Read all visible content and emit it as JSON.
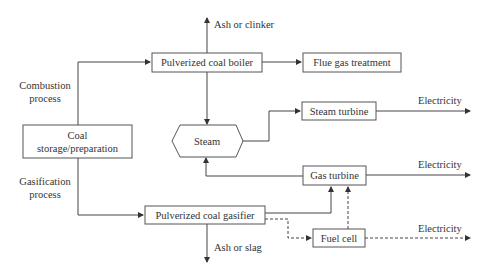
{
  "diagram": {
    "nodes": {
      "coal_storage": {
        "line1": "Coal",
        "line2": "storage/preparation"
      },
      "boiler": {
        "label": "Pulverized coal boiler"
      },
      "flue_gas": {
        "label": "Flue gas treatment"
      },
      "steam": {
        "label": "Steam"
      },
      "steam_turbine": {
        "label": "Steam turbine"
      },
      "gas_turbine": {
        "label": "Gas turbine"
      },
      "gasifier": {
        "label": "Pulverized coal gasifier"
      },
      "fuel_cell": {
        "label": "Fuel cell"
      }
    },
    "labels": {
      "combustion_1": "Combustion",
      "combustion_2": "process",
      "gasification_1": "Gasification",
      "gasification_2": "process",
      "ash_clinker": "Ash or clinker",
      "ash_slag": "Ash or slag",
      "electricity_steam": "Electricity",
      "electricity_gas": "Electricity",
      "electricity_fuel": "Electricity"
    },
    "colors": {
      "stroke": "#444444",
      "text": "#333333",
      "background": "#ffffff"
    }
  }
}
